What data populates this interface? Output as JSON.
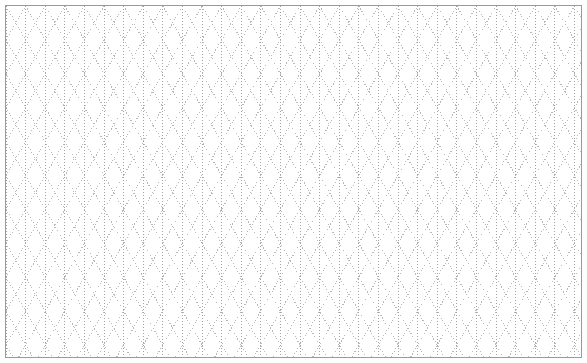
{
  "document": {
    "kind": "isometric-dot-grid-paper",
    "title": "Isometric Dot Grid Paper",
    "page_width": 587,
    "page_height": 363,
    "background_color": "#ffffff"
  },
  "frame": {
    "visible": true,
    "inset_left": 5,
    "inset_top": 5,
    "inset_right": 5,
    "inset_bottom": 5,
    "border_width": 1,
    "border_color": "#9a9a9a",
    "fill_color": "#ffffff"
  },
  "grid": {
    "style": "triangular-isometric",
    "line_style": "dotted",
    "dot_color": "#b9b9b9",
    "dot_color_strong": "#a2a2a2",
    "dot_size": 1,
    "dot_gap": 2,
    "column_spacing": 19.6,
    "row_spacing": 33.9,
    "diagonal_angle_degrees": 60,
    "vertical_lines": true,
    "diagonal_lines_up": true,
    "diagonal_lines_down": true,
    "horizontal_lines": false,
    "column_count": 30,
    "row_count": 11
  },
  "chart_data": {
    "type": "table",
    "xlabel": "",
    "ylabel": "",
    "categories": [
      "vertical-rules",
      "diagonal-up-rules",
      "diagonal-down-rules"
    ],
    "values": [
      30,
      34,
      34
    ],
    "grid": "on",
    "legend": "none"
  }
}
